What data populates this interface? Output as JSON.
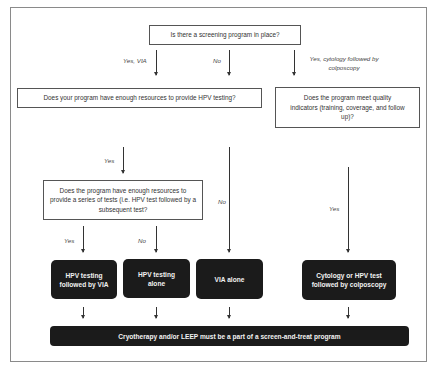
{
  "diagram": {
    "title_question": "Is there a screening program in place?",
    "branches_top": {
      "yes_via": "Yes, VIA",
      "no": "No",
      "yes_cytology": "Yes, cytology followed by colposcopy"
    },
    "question_hpv_resources": "Does your program have enough resources to provide HPV testing?",
    "question_quality": "Does the program meet quality indicators (training, coverage, and follow up)?",
    "label_yes_hpv": "Yes",
    "label_no_hpv": "No",
    "label_yes_quality": "Yes",
    "question_series": "Does the program have enough resources to provide a series of tests (i.e. HPV test followed by a subsequent test?",
    "label_yes_series": "Yes",
    "label_no_series": "No",
    "outcomes": [
      "HPV testing followed by VIA",
      "HPV testing alone",
      "VIA alone",
      "Cytology or HPV test followed by colposcopy"
    ],
    "final": "Cryotherapy and/or LEEP must be a part of a screen-and-treat program"
  },
  "colors": {
    "dark_box": "#1b1b1b",
    "border": "#555555",
    "frame": "#8a8a8a"
  }
}
